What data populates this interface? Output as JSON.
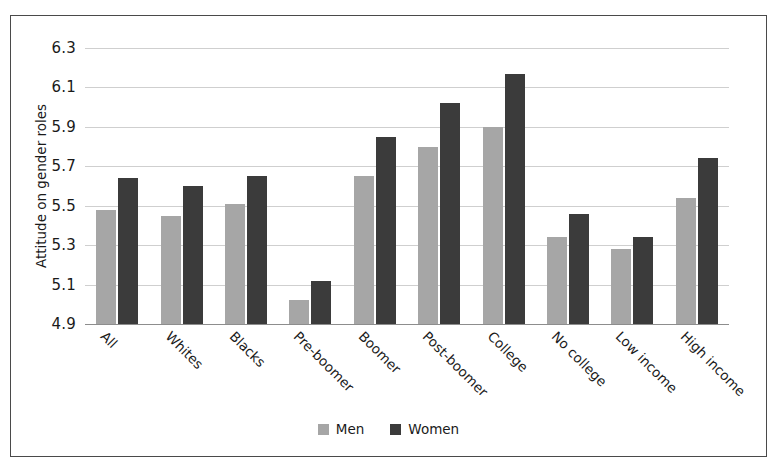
{
  "chart_data": {
    "type": "bar",
    "title": "",
    "xlabel": "",
    "ylabel": "Attitude on gender roles",
    "ylim": [
      4.9,
      6.3
    ],
    "yticks": [
      "4.9",
      "5.1",
      "5.3",
      "5.5",
      "5.7",
      "5.9",
      "6.1",
      "6.3"
    ],
    "ytick_values": [
      4.9,
      5.1,
      5.3,
      5.5,
      5.7,
      5.9,
      6.1,
      6.3
    ],
    "grid": true,
    "legend_position": "bottom-center",
    "categories": [
      "All",
      "Whites",
      "Blacks",
      "Pre-boomer",
      "Boomer",
      "Post-boomer",
      "College",
      "No college",
      "Low income",
      "High income"
    ],
    "series": [
      {
        "name": "Men",
        "color": "#a6a6a6",
        "values": [
          5.48,
          5.45,
          5.51,
          5.02,
          5.65,
          5.8,
          5.9,
          5.34,
          5.28,
          5.54
        ]
      },
      {
        "name": "Women",
        "color": "#3b3b3b",
        "values": [
          5.64,
          5.6,
          5.65,
          5.12,
          5.85,
          6.02,
          6.17,
          5.46,
          5.34,
          5.74
        ]
      }
    ]
  },
  "legend": {
    "items": [
      {
        "label": "Men",
        "swatch": "men-swatch"
      },
      {
        "label": "Women",
        "swatch": "women-swatch"
      }
    ]
  },
  "colors": {
    "men": "#a6a6a6",
    "women": "#3b3b3b",
    "gridline": "#cfcfcf",
    "axis": "#8d8d8d",
    "border": "#4a4a4a",
    "background": "#ffffff",
    "text": "#1a1a1a"
  }
}
